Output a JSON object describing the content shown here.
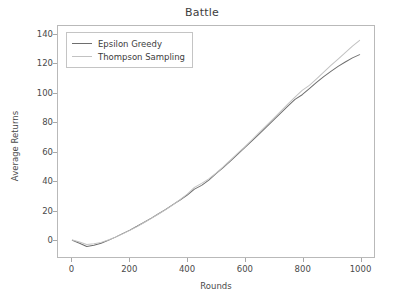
{
  "chart_data": {
    "type": "line",
    "title": "Battle",
    "xlabel": "Rounds",
    "ylabel": "Average Returns",
    "xlim": [
      -50,
      1050
    ],
    "ylim": [
      -12,
      146
    ],
    "xticks": [
      0,
      200,
      400,
      600,
      800,
      1000
    ],
    "yticks": [
      0,
      20,
      40,
      60,
      80,
      100,
      120,
      140
    ],
    "grid": false,
    "legend_position": "upper left",
    "x": [
      0,
      25,
      50,
      75,
      100,
      125,
      150,
      175,
      200,
      225,
      250,
      275,
      300,
      325,
      350,
      375,
      400,
      425,
      450,
      475,
      500,
      525,
      550,
      575,
      600,
      625,
      650,
      675,
      700,
      725,
      750,
      775,
      800,
      825,
      850,
      875,
      900,
      925,
      950,
      975,
      1000
    ],
    "series": [
      {
        "name": "Epsilon Greedy",
        "color": "#6e6e6e",
        "values": [
          -0.5,
          -2.6,
          -4.8,
          -4.0,
          -2.6,
          -0.6,
          1.6,
          4.0,
          6.4,
          9.0,
          11.8,
          14.6,
          17.6,
          20.6,
          23.8,
          27.0,
          30.4,
          34.4,
          37.0,
          40.6,
          45.0,
          49.2,
          53.6,
          58.2,
          62.8,
          67.4,
          72.0,
          76.8,
          81.6,
          86.4,
          91.2,
          95.8,
          99.0,
          103.2,
          107.4,
          111.4,
          115.0,
          118.4,
          121.4,
          124.2,
          126.4
        ]
      },
      {
        "name": "Thompson Sampling",
        "color": "#c2c2c2",
        "values": [
          -0.4,
          -1.8,
          -3.4,
          -3.0,
          -2.0,
          -0.4,
          1.6,
          3.8,
          6.2,
          8.8,
          11.6,
          14.4,
          17.4,
          20.4,
          23.6,
          27.2,
          31.0,
          35.6,
          38.4,
          41.4,
          45.4,
          49.6,
          54.2,
          58.8,
          63.4,
          68.2,
          73.0,
          77.8,
          82.6,
          87.6,
          92.6,
          97.4,
          102.0,
          105.4,
          109.8,
          114.4,
          119.0,
          123.4,
          127.8,
          132.2,
          136.2
        ]
      }
    ]
  },
  "legend": {
    "items": [
      {
        "label": "Epsilon Greedy"
      },
      {
        "label": "Thompson Sampling"
      }
    ]
  }
}
